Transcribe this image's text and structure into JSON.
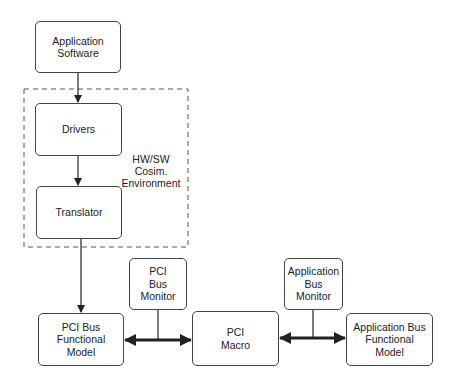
{
  "diagram": {
    "nodes": {
      "app_software": "Application\nSoftware",
      "drivers": "Drivers",
      "translator": "Translator",
      "pci_bus_monitor": "PCI\nBus\nMonitor",
      "app_bus_monitor": "Application\nBus\nMonitor",
      "pci_bus_functional_model": "PCI Bus\nFunctional\nModel",
      "pci_macro": "PCI\nMacro",
      "app_bus_functional_model": "Application Bus\nFunctional\nModel"
    },
    "group_label": "HW/SW\nCosim.\nEnvironment",
    "edges": [
      {
        "from": "Application Software",
        "to": "Drivers",
        "type": "arrow"
      },
      {
        "from": "Drivers",
        "to": "Translator",
        "type": "arrow"
      },
      {
        "from": "Translator",
        "to": "PCI Bus Functional Model",
        "type": "arrow"
      },
      {
        "from": "PCI Bus Functional Model",
        "to": "PCI Macro",
        "type": "bidirectional-bus"
      },
      {
        "from": "PCI Bus Monitor",
        "to": "PCI bus",
        "type": "line"
      },
      {
        "from": "PCI Macro",
        "to": "Application Bus Functional Model",
        "type": "bidirectional-bus"
      },
      {
        "from": "Application Bus Monitor",
        "to": "Application bus",
        "type": "line"
      }
    ]
  }
}
